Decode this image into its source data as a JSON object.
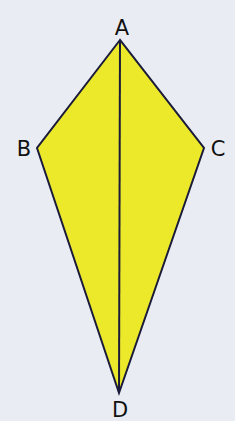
{
  "diagram": {
    "shape": "kite",
    "fill_color": "#ece82a",
    "stroke_color": "#1a1a3a",
    "background_color": "#e9ecf2",
    "vertices": {
      "A": {
        "label": "A",
        "x": 120,
        "y": 40
      },
      "B": {
        "label": "B",
        "x": 37,
        "y": 148
      },
      "C": {
        "label": "C",
        "x": 204,
        "y": 148
      },
      "D": {
        "label": "D",
        "x": 119,
        "y": 393
      }
    },
    "segments": [
      [
        "A",
        "B"
      ],
      [
        "B",
        "D"
      ],
      [
        "D",
        "C"
      ],
      [
        "C",
        "A"
      ],
      [
        "A",
        "D"
      ]
    ]
  }
}
